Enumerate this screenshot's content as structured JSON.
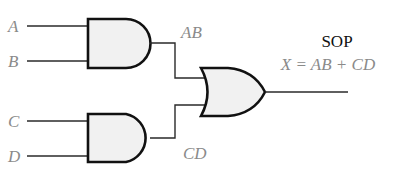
{
  "diagram": {
    "type": "logic-circuit",
    "inputs": [
      {
        "label": "A"
      },
      {
        "label": "B"
      },
      {
        "label": "C"
      },
      {
        "label": "D"
      }
    ],
    "gates": [
      {
        "type": "AND",
        "inputs": [
          "A",
          "B"
        ],
        "output_label": "AB"
      },
      {
        "type": "AND",
        "inputs": [
          "C",
          "D"
        ],
        "output_label": "CD"
      },
      {
        "type": "OR",
        "inputs": [
          "AB",
          "CD"
        ],
        "output_label": "X"
      }
    ],
    "title": "SOP",
    "expression": "X = AB + CD"
  },
  "colors": {
    "label": "#8a8a8a",
    "title": "#111111",
    "gate_fill": "#f1f1f1",
    "gate_stroke": "#111111"
  }
}
